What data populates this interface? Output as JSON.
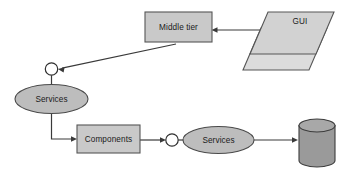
{
  "diagram": {
    "background_color": "#ffffff",
    "palette": {
      "box_fill": "#c9c9c9",
      "ellipse_fill": "#bdbdbd",
      "parallelogram_fill": "#d2d2d2",
      "parallelogram_back_fill": "#dcdcdc",
      "cylinder_fill": "#9a9a9a",
      "cylinder_top_fill": "#a8a8a8",
      "stroke": "#565656",
      "connector": "#3a3a3a",
      "socket_fill": "#ffffff",
      "text": "#1a1a1a"
    },
    "nodes": [
      {
        "id": "middle-tier",
        "kind": "rectangle",
        "label": "Middle tier",
        "x": 145,
        "y": 12,
        "w": 67,
        "h": 30,
        "label_x": 178.5,
        "label_y": 27.5
      },
      {
        "id": "gui",
        "kind": "parallelogram-stack",
        "label": "GUI",
        "label_x": 300,
        "label_y": 22,
        "front_points": "268,12 334,12 316,54 250,54",
        "back_points": "261,28 327,28 309,70 243,70"
      },
      {
        "id": "services-left",
        "kind": "ellipse",
        "label": "Services",
        "cx": 51.5,
        "cy": 99,
        "rx": 36.5,
        "ry": 14.5,
        "label_x": 51.5,
        "label_y": 99.5
      },
      {
        "id": "components",
        "kind": "rectangle",
        "label": "Components",
        "x": 77,
        "y": 125,
        "w": 63,
        "h": 28,
        "label_x": 108.5,
        "label_y": 139.5
      },
      {
        "id": "services-right",
        "kind": "ellipse",
        "label": "Services",
        "cx": 218.5,
        "cy": 140,
        "rx": 35.5,
        "ry": 13.5,
        "label_x": 218.5,
        "label_y": 140.5
      },
      {
        "id": "database",
        "kind": "cylinder",
        "label": "",
        "x": 299,
        "y": 119,
        "w": 36,
        "h": 48,
        "ellipse_ry": 6.5
      }
    ],
    "sockets": [
      {
        "id": "socket-upper",
        "cx": 51.5,
        "cy": 69,
        "r": 6.2
      },
      {
        "id": "socket-lower",
        "cx": 172,
        "cy": 140,
        "r": 6.2
      }
    ],
    "connectors": [
      {
        "id": "gui-to-middle-tier",
        "from": "gui",
        "to": "middle-tier",
        "path": "M 262,30 L 216,30",
        "arrow_at": "212,30",
        "arrow_dir": "left"
      },
      {
        "id": "middle-tier-to-socket-upper",
        "from": "middle-tier",
        "to": "socket-upper",
        "path": "M 175,44 L 62,68",
        "arrow_at": "58,69",
        "arrow_dir": "left-down"
      },
      {
        "id": "socket-upper-to-services-left",
        "from": "socket-upper",
        "to": "services-left",
        "path": "M 51.5,75.2 L 51.5,85",
        "arrow_at": "",
        "arrow_dir": "none"
      },
      {
        "id": "services-left-to-components",
        "from": "services-left",
        "to": "components",
        "path": "M 51.5,113.5 L 51.5,139 L 73,139",
        "arrow_at": "77,139",
        "arrow_dir": "right"
      },
      {
        "id": "components-to-socket-lower",
        "from": "components",
        "to": "socket-lower",
        "path": "M 140,140 L 162,140",
        "arrow_at": "166,140",
        "arrow_dir": "right"
      },
      {
        "id": "socket-lower-to-services-right",
        "from": "socket-lower",
        "to": "services-right",
        "path": "M 178.2,140 L 183,140",
        "arrow_at": "",
        "arrow_dir": "none"
      },
      {
        "id": "services-right-to-database",
        "from": "services-right",
        "to": "database",
        "path": "M 254,140 L 295,140",
        "arrow_at": "299,140",
        "arrow_dir": "right"
      }
    ]
  }
}
